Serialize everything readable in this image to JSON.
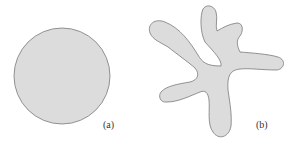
{
  "figure": {
    "panels": [
      {
        "id": "a",
        "label": "(a)",
        "shape": "circle",
        "fill": "#dcdcdc",
        "stroke": "#777777"
      },
      {
        "id": "b",
        "label": "(b)",
        "shape": "irregular-blob",
        "fill": "#dcdcdc",
        "stroke": "#777777"
      }
    ]
  }
}
